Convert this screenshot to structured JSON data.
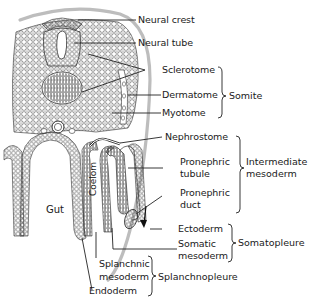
{
  "figure": {
    "structure_labels": {
      "neural_crest": "Neural crest",
      "neural_tube": "Neural tube",
      "sclerotome": "Sclerotome",
      "dermatome": "Dermatome",
      "myotome": "Myotome",
      "nephrostome": "Nephrostome",
      "pronephric_tubule_1": "Pronephric",
      "pronephric_tubule_2": "tubule",
      "pronephric_duct_1": "Pronephric",
      "pronephric_duct_2": "duct",
      "ectoderm": "Ectoderm",
      "somatic_mesoderm_1": "Somatic",
      "somatic_mesoderm_2": "mesoderm",
      "splanchnic_mesoderm_1": "Splanchnic",
      "splanchnic_mesoderm_2": "mesoderm",
      "endoderm": "Endoderm",
      "gut": "Gut",
      "coelom": "Coelom"
    },
    "group_labels": {
      "somite": "Somite",
      "intermediate_mesoderm_1": "Intermediate",
      "intermediate_mesoderm_2": "mesoderm",
      "somatopleure": "Somatopleure",
      "splanchnopleure": "Splanchnopleure"
    },
    "colors": {
      "ink": "#1a1a1a",
      "ectoderm_band": "#bdbdbd",
      "background": "#ffffff"
    }
  }
}
